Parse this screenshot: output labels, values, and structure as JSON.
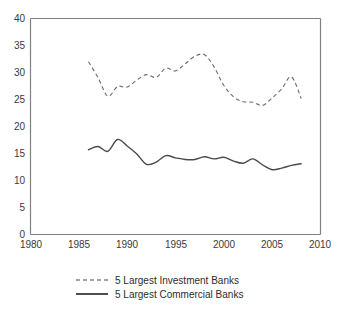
{
  "chart_data": {
    "type": "line",
    "title": "",
    "subtitle": "",
    "xlabel": "",
    "ylabel": "",
    "xlim": [
      1980,
      2010
    ],
    "ylim": [
      0,
      40
    ],
    "grid": false,
    "legend_position": "bottom",
    "x_ticks": [
      "1980",
      "1985",
      "1990",
      "1995",
      "2000",
      "2005",
      "2010"
    ],
    "y_ticks": [
      "0",
      "5",
      "10",
      "15",
      "20",
      "25",
      "30",
      "35",
      "40"
    ],
    "series": [
      {
        "name": "5 Largest Investment Banks",
        "style": "dashed",
        "color": "#6b6b6b",
        "x": [
          1986,
          1987,
          1988,
          1989,
          1990,
          1991,
          1992,
          1993,
          1994,
          1995,
          1996,
          1997,
          1998,
          1999,
          2000,
          2001,
          2002,
          2003,
          2004,
          2005,
          2006,
          2007,
          2008
        ],
        "values": [
          32.0,
          29.0,
          25.6,
          27.4,
          27.3,
          28.6,
          29.6,
          29.1,
          30.8,
          30.3,
          31.6,
          33.0,
          33.3,
          31.0,
          27.6,
          25.5,
          24.6,
          24.5,
          23.9,
          25.3,
          27.0,
          29.2,
          25.2
        ]
      },
      {
        "name": "5 Largest Commercial Banks",
        "style": "solid",
        "color": "#4a4a4a",
        "x": [
          1986,
          1987,
          1988,
          1989,
          1990,
          1991,
          1992,
          1993,
          1994,
          1995,
          1996,
          1997,
          1998,
          1999,
          2000,
          2001,
          2002,
          2003,
          2004,
          2005,
          2006,
          2007,
          2008
        ],
        "values": [
          15.7,
          16.3,
          15.4,
          17.6,
          16.4,
          14.9,
          13.0,
          13.4,
          14.6,
          14.2,
          13.9,
          13.9,
          14.4,
          14.0,
          14.3,
          13.6,
          13.2,
          14.0,
          12.9,
          12.0,
          12.3,
          12.8,
          13.1
        ]
      }
    ]
  },
  "legend": {
    "items": [
      {
        "label": "5 Largest Investment Banks",
        "style": "dashed"
      },
      {
        "label": "5 Largest Commercial Banks",
        "style": "solid"
      }
    ]
  },
  "axis": {
    "x_ticks": [
      "1980",
      "1985",
      "1990",
      "1995",
      "2000",
      "2005",
      "2010"
    ],
    "y_ticks": [
      "40",
      "35",
      "30",
      "25",
      "20",
      "15",
      "10",
      "5",
      "0"
    ]
  }
}
